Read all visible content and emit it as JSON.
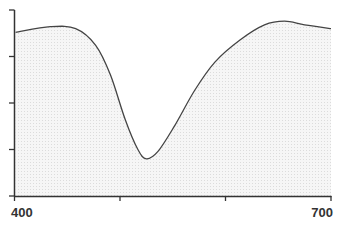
{
  "chart_data": {
    "type": "area",
    "title": "",
    "xlabel": "",
    "ylabel": "",
    "xlim": [
      400,
      700
    ],
    "ylim": [
      0,
      1
    ],
    "x_tick_labels": [
      "400",
      "700"
    ],
    "x_ticks": [
      400,
      500,
      600,
      700
    ],
    "y_ticks_count": 5,
    "y_tick_labels": [],
    "grid": false,
    "legend": null,
    "series": [
      {
        "name": "spectrum",
        "x": [
          401,
          434,
          458,
          477,
          491,
          505,
          517,
          525,
          536,
          552,
          571,
          590,
          614,
          637,
          656,
          675,
          700
        ],
        "values": [
          0.88,
          0.91,
          0.9,
          0.81,
          0.65,
          0.41,
          0.25,
          0.2,
          0.24,
          0.38,
          0.57,
          0.72,
          0.84,
          0.92,
          0.94,
          0.92,
          0.9
        ]
      }
    ],
    "colors": {
      "line": "#444444",
      "fill": "#f0f0f0",
      "axis": "#333333"
    }
  }
}
